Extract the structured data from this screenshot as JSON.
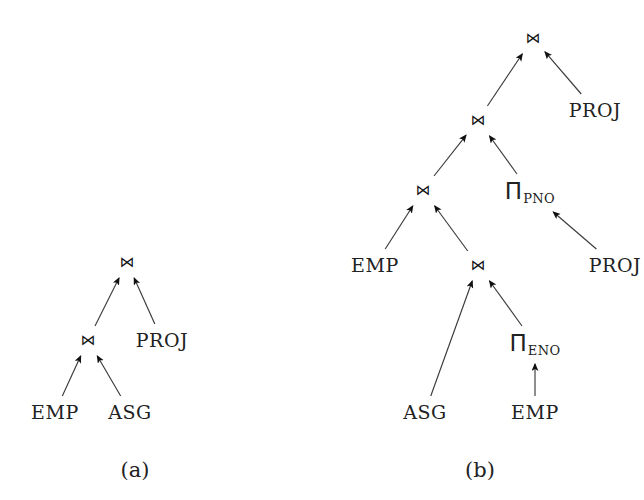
{
  "figure": {
    "width": 644,
    "height": 500,
    "background": "#ffffff",
    "ink": "#222222"
  },
  "symbols": {
    "join": "⋈",
    "pi": "Π"
  },
  "diagram_a": {
    "caption": "(a)",
    "caption_pos": {
      "x": 135,
      "y": 470
    },
    "nodes": [
      {
        "id": "a-root-join",
        "kind": "join",
        "label": "⋈",
        "x": 127,
        "y": 262
      },
      {
        "id": "a-join-2",
        "kind": "join",
        "label": "⋈",
        "x": 88,
        "y": 340
      },
      {
        "id": "a-proj-rel",
        "kind": "rel",
        "label": "PROJ",
        "x": 162,
        "y": 340
      },
      {
        "id": "a-emp",
        "kind": "rel",
        "label": "EMP",
        "x": 55,
        "y": 412
      },
      {
        "id": "a-asg",
        "kind": "rel",
        "label": "ASG",
        "x": 130,
        "y": 412
      }
    ],
    "edges": [
      {
        "from": "a-join-2",
        "to": "a-root-join"
      },
      {
        "from": "a-proj-rel",
        "to": "a-root-join"
      },
      {
        "from": "a-emp",
        "to": "a-join-2"
      },
      {
        "from": "a-asg",
        "to": "a-join-2"
      }
    ]
  },
  "diagram_b": {
    "caption": "(b)",
    "caption_pos": {
      "x": 480,
      "y": 470
    },
    "nodes": [
      {
        "id": "b-root-join",
        "kind": "join",
        "label": "⋈",
        "x": 533,
        "y": 38
      },
      {
        "id": "b-join-2",
        "kind": "join",
        "label": "⋈",
        "x": 478,
        "y": 120
      },
      {
        "id": "b-proj-rel-1",
        "kind": "rel",
        "label": "PROJ",
        "x": 595,
        "y": 110
      },
      {
        "id": "b-join-3",
        "kind": "join",
        "label": "⋈",
        "x": 423,
        "y": 190
      },
      {
        "id": "b-pi-pno",
        "kind": "proj",
        "label": "Π",
        "subscript": "PNO",
        "x": 530,
        "y": 192
      },
      {
        "id": "b-emp-1",
        "kind": "rel",
        "label": "EMP",
        "x": 375,
        "y": 265
      },
      {
        "id": "b-join-4",
        "kind": "join",
        "label": "⋈",
        "x": 478,
        "y": 265
      },
      {
        "id": "b-proj-rel-2",
        "kind": "rel",
        "label": "PROJ",
        "x": 615,
        "y": 265
      },
      {
        "id": "b-asg",
        "kind": "rel",
        "label": "ASG",
        "x": 425,
        "y": 412
      },
      {
        "id": "b-pi-eno",
        "kind": "proj",
        "label": "Π",
        "subscript": "ENO",
        "x": 535,
        "y": 344
      },
      {
        "id": "b-emp-2",
        "kind": "rel",
        "label": "EMP",
        "x": 535,
        "y": 412
      }
    ],
    "edges": [
      {
        "from": "b-join-2",
        "to": "b-root-join"
      },
      {
        "from": "b-proj-rel-1",
        "to": "b-root-join"
      },
      {
        "from": "b-join-3",
        "to": "b-join-2"
      },
      {
        "from": "b-pi-pno",
        "to": "b-join-2"
      },
      {
        "from": "b-proj-rel-2",
        "to": "b-pi-pno"
      },
      {
        "from": "b-emp-1",
        "to": "b-join-3"
      },
      {
        "from": "b-join-4",
        "to": "b-join-3"
      },
      {
        "from": "b-asg",
        "to": "b-join-4"
      },
      {
        "from": "b-pi-eno",
        "to": "b-join-4"
      },
      {
        "from": "b-emp-2",
        "to": "b-pi-eno"
      }
    ]
  }
}
